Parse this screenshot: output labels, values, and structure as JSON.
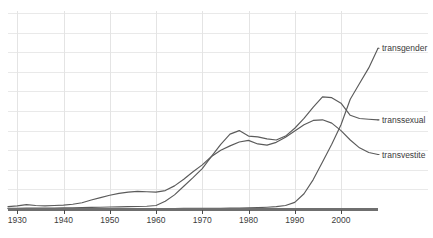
{
  "chart_data": {
    "type": "line",
    "title": "",
    "subtitle": "",
    "xlabel": "",
    "ylabel": "",
    "grid": true,
    "legend_position": "right-inline",
    "xlim": [
      1928,
      2008
    ],
    "ylim": [
      0,
      1.0
    ],
    "xticks": [
      1930,
      1940,
      1950,
      1960,
      1970,
      1980,
      1990,
      2000
    ],
    "xticklabels": [
      "1930",
      "1940",
      "1950",
      "1960",
      "1970",
      "1980",
      "1990",
      "2000"
    ],
    "yticks": [],
    "yticklabels": [],
    "x": [
      1928,
      1930,
      1932,
      1934,
      1936,
      1938,
      1940,
      1942,
      1944,
      1946,
      1948,
      1950,
      1952,
      1954,
      1956,
      1958,
      1960,
      1962,
      1964,
      1966,
      1968,
      1970,
      1972,
      1974,
      1976,
      1978,
      1980,
      1982,
      1984,
      1986,
      1988,
      1990,
      1992,
      1994,
      1996,
      1998,
      2000,
      2002,
      2004,
      2006,
      2008
    ],
    "series": [
      {
        "name": "transvestite",
        "color": "#5b5b5b",
        "label": "transvestite",
        "values": [
          0.012,
          0.016,
          0.022,
          0.018,
          0.016,
          0.018,
          0.02,
          0.024,
          0.032,
          0.046,
          0.058,
          0.07,
          0.08,
          0.086,
          0.09,
          0.088,
          0.086,
          0.094,
          0.118,
          0.152,
          0.19,
          0.225,
          0.268,
          0.3,
          0.322,
          0.342,
          0.35,
          0.332,
          0.326,
          0.34,
          0.366,
          0.398,
          0.43,
          0.452,
          0.455,
          0.438,
          0.4,
          0.352,
          0.312,
          0.288,
          0.278
        ]
      },
      {
        "name": "transsexual",
        "color": "#5b5b5b",
        "label": "transsexual",
        "values": [
          0.004,
          0.004,
          0.005,
          0.005,
          0.005,
          0.005,
          0.006,
          0.006,
          0.007,
          0.008,
          0.009,
          0.01,
          0.011,
          0.012,
          0.013,
          0.014,
          0.018,
          0.04,
          0.072,
          0.116,
          0.16,
          0.206,
          0.268,
          0.33,
          0.382,
          0.4,
          0.372,
          0.368,
          0.358,
          0.352,
          0.372,
          0.412,
          0.462,
          0.52,
          0.572,
          0.568,
          0.54,
          0.478,
          0.462,
          0.458,
          0.455
        ]
      },
      {
        "name": "transgender",
        "color": "#5b5b5b",
        "label": "transgender",
        "values": [
          0.002,
          0.002,
          0.002,
          0.002,
          0.002,
          0.002,
          0.002,
          0.002,
          0.002,
          0.002,
          0.002,
          0.002,
          0.002,
          0.002,
          0.002,
          0.002,
          0.002,
          0.002,
          0.002,
          0.003,
          0.003,
          0.003,
          0.004,
          0.004,
          0.005,
          0.005,
          0.006,
          0.007,
          0.009,
          0.012,
          0.018,
          0.034,
          0.078,
          0.15,
          0.24,
          0.33,
          0.43,
          0.56,
          0.64,
          0.72,
          0.82
        ]
      }
    ]
  },
  "axis": {
    "tick_labels": [
      "1930",
      "1940",
      "1950",
      "1960",
      "1970",
      "1980",
      "1990",
      "2000"
    ]
  },
  "labels": {
    "transgender": "transgender",
    "transsexual": "transsexual",
    "transvestite": "transvestite"
  },
  "colors": {
    "line": "#5b5b5b",
    "grid": "#e9e9e9",
    "axis": "#6f6f6f",
    "text": "#3c3c3c",
    "background": "#ffffff"
  }
}
